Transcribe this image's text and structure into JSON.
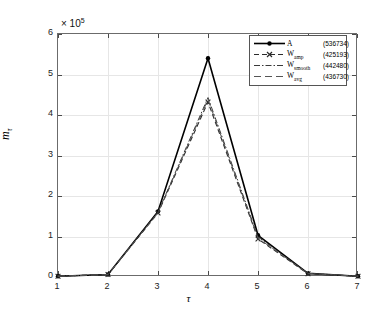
{
  "chart_data": {
    "type": "line",
    "title": "",
    "xlabel": "τ",
    "ylabel": "mτ",
    "ylabel_base": "m",
    "ylabel_sub": "τ",
    "y_exponent_label": "× 10",
    "y_exponent_power": "5",
    "y_multiplier": 100000,
    "x": [
      1,
      2,
      3,
      4,
      5,
      6,
      7
    ],
    "xlim": [
      1,
      7
    ],
    "ylim": [
      0,
      600000
    ],
    "xticks": [
      "1",
      "2",
      "3",
      "4",
      "5",
      "6",
      "7"
    ],
    "yticks": [
      "0",
      "1",
      "2",
      "3",
      "4",
      "5",
      "6"
    ],
    "ytick_values": [
      0,
      100000,
      200000,
      300000,
      400000,
      500000,
      600000
    ],
    "grid": true,
    "legend_position": "top-right",
    "series": [
      {
        "name": "A",
        "legend_label": "A",
        "legend_sub": "",
        "total": "(536734)",
        "total_value": 536734,
        "color": "#000000",
        "linestyle": "solid",
        "marker": "dot",
        "width": 1.6,
        "values": [
          2000,
          6000,
          162000,
          540000,
          103000,
          9000,
          2000
        ]
      },
      {
        "name": "W_amp",
        "legend_label": "W",
        "legend_sub": "amp",
        "total": "(425193)",
        "total_value": 425193,
        "color": "#2b2b2b",
        "linestyle": "dashed",
        "marker": "x",
        "width": 1.1,
        "values": [
          2000,
          6000,
          158000,
          432000,
          94000,
          8000,
          2000
        ]
      },
      {
        "name": "W_smooth",
        "legend_label": "W",
        "legend_sub": "smooth",
        "total": "(442480)",
        "total_value": 442480,
        "color": "#3a3a3a",
        "linestyle": "dashdot",
        "marker": "none",
        "width": 1.0,
        "values": [
          2000,
          6000,
          160000,
          443000,
          99000,
          9000,
          2000
        ]
      },
      {
        "name": "W_avg",
        "legend_label": "W",
        "legend_sub": "avg",
        "total": "(436730)",
        "total_value": 436730,
        "color": "#555555",
        "linestyle": "dashed-long",
        "marker": "none",
        "width": 1.0,
        "values": [
          2000,
          6000,
          159000,
          438000,
          96000,
          8500,
          2000
        ]
      }
    ]
  },
  "axes": {
    "frame_color": "#6b6b6b",
    "grid_color": "#e6e6e6",
    "tick_color": "#4a4a4a"
  }
}
